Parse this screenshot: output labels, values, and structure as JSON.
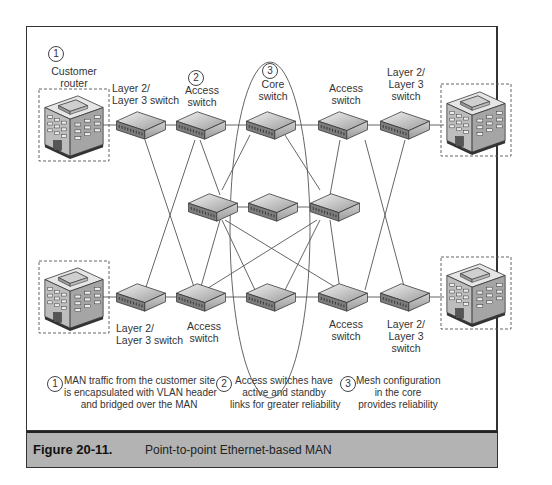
{
  "figure": {
    "number": "Figure 20-11.",
    "title": "Point-to-point Ethernet-based MAN"
  },
  "labels": {
    "customer_router": "Customer\nrouter",
    "l2l3_top_left": "Layer 2/\nLayer 3 switch",
    "access_top_left": "Access\nswitch",
    "core": "Core\nswitch",
    "access_top_right": "Access\nswitch",
    "l2l3_top_right": "Layer 2/\nLayer 3\nswitch",
    "l2l3_bottom_left": "Layer 2/\nLayer 3 switch",
    "access_bottom_left": "Access\nswitch",
    "access_bottom_right": "Access\nswitch",
    "l2l3_bottom_right": "Layer 2/\nLayer 3\nswitch"
  },
  "markers": [
    "1",
    "2",
    "3"
  ],
  "notes": [
    {
      "num": "1",
      "text": "MAN traffic from the customer site\nis encapsulated with VLAN header\nand bridged over the MAN"
    },
    {
      "num": "2",
      "text": "Access switches have\nactive and standby\nlinks for greater reliability"
    },
    {
      "num": "3",
      "text": "Mesh configuration\nin the core\nprovides reliability"
    }
  ]
}
